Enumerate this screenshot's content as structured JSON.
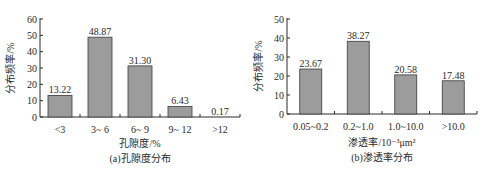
{
  "chart_data": [
    {
      "type": "bar",
      "title": "(a)孔隙度分布",
      "xlabel": "孔隙度/%",
      "ylabel": "分布频率/%",
      "categories": [
        "<3",
        "3~ 6",
        "6~ 9",
        "9~ 12",
        ">12"
      ],
      "values": [
        13.22,
        48.87,
        31.3,
        6.43,
        0.17
      ],
      "value_labels": [
        "13.22",
        "48.87",
        "31.30",
        "6.43",
        "0.17"
      ],
      "ylim": [
        0,
        60
      ],
      "yticks": [
        "0",
        "10",
        "20",
        "30",
        "40",
        "50",
        "60"
      ],
      "grid": false,
      "legend": null
    },
    {
      "type": "bar",
      "title": "(b)渗透率分布",
      "xlabel": "渗透率/10⁻³μm²",
      "ylabel": "分布频率/%",
      "categories": [
        "0.05~0.2",
        "0.2~1.0",
        "1.0~10.0",
        ">10.0"
      ],
      "values": [
        23.67,
        38.27,
        20.58,
        17.48
      ],
      "value_labels": [
        "23.67",
        "38.27",
        "20.58",
        "17.48"
      ],
      "ylim": [
        0,
        50
      ],
      "yticks": [
        "0",
        "10",
        "20",
        "30",
        "40",
        "50"
      ],
      "grid": false,
      "legend": null
    }
  ],
  "colors": {
    "bar_fill": "#9c9c9c",
    "bar_stroke": "#3a3a3a",
    "axis": "#2a2a2a"
  }
}
